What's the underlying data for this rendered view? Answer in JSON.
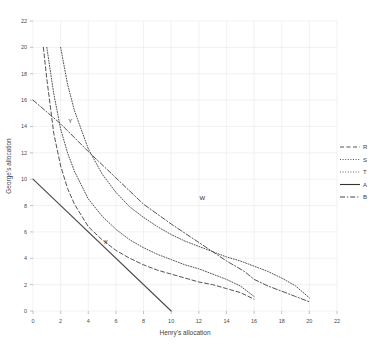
{
  "chart_data": {
    "type": "line",
    "title": "",
    "xlabel": "Henry's allocation",
    "ylabel": "George's allocation",
    "xlim": [
      0,
      22
    ],
    "ylim": [
      0,
      22
    ],
    "xticks": [
      0,
      2,
      4,
      6,
      8,
      10,
      12,
      14,
      16,
      18,
      20,
      22
    ],
    "yticks": [
      0,
      2,
      4,
      6,
      8,
      10,
      12,
      14,
      16,
      18,
      20,
      22
    ],
    "grid": true,
    "legend_position": "right",
    "series": [
      {
        "name": "R",
        "label": "R",
        "style": "dashed",
        "color": "#4a4a4a",
        "x": [
          0.75,
          1.0,
          1.5,
          2.0,
          2.5,
          3.0,
          4.0,
          5.0,
          6.0,
          7.0,
          8.0,
          9.0,
          10.0,
          11.0,
          12.0,
          13.0,
          14.0,
          15.0,
          16.0
        ],
        "y": [
          20.0,
          17.6,
          13.5,
          11.0,
          9.3,
          8.1,
          6.4,
          5.4,
          4.6,
          4.0,
          3.5,
          3.1,
          2.8,
          2.5,
          2.2,
          2.0,
          1.7,
          1.4,
          0.9
        ]
      },
      {
        "name": "S",
        "label": "S",
        "style": "dotted",
        "color": "#4a4a4a",
        "x": [
          1.0,
          1.5,
          2.0,
          2.5,
          3.0,
          4.0,
          5.0,
          6.0,
          7.0,
          8.0,
          9.0,
          10.0,
          11.0,
          12.0,
          13.0,
          14.0,
          15.0,
          16.0
        ],
        "y": [
          20.0,
          16.5,
          13.8,
          12.0,
          10.6,
          8.5,
          7.2,
          6.2,
          5.4,
          4.8,
          4.3,
          3.9,
          3.5,
          3.2,
          2.8,
          2.4,
          1.9,
          1.1
        ]
      },
      {
        "name": "T",
        "label": "T",
        "style": "dotted",
        "color": "#5a5a5a",
        "x": [
          2.0,
          2.5,
          3.0,
          4.0,
          5.0,
          6.0,
          7.0,
          8.0,
          9.0,
          10.0,
          11.0,
          12.0,
          13.0,
          14.0,
          15.0,
          16.0,
          17.0,
          18.0,
          19.0,
          20.0
        ],
        "y": [
          20.0,
          17.2,
          15.2,
          12.3,
          10.4,
          9.0,
          7.9,
          7.1,
          6.4,
          5.8,
          5.3,
          4.9,
          4.5,
          4.1,
          3.8,
          3.4,
          3.0,
          2.5,
          1.9,
          1.0
        ]
      },
      {
        "name": "A",
        "label": "A",
        "style": "solid",
        "color": "#333333",
        "x": [
          0,
          10
        ],
        "y": [
          10,
          0
        ]
      },
      {
        "name": "B",
        "label": "B",
        "style": "dashdot",
        "color": "#3d3d3d",
        "x": [
          0,
          2.0,
          4.0,
          6.0,
          8.0,
          10.0,
          12.0,
          14.0,
          15.3,
          16.0,
          17.0,
          18.0,
          19.0,
          20.0
        ],
        "y": [
          16,
          14.2,
          12.1,
          10.1,
          8.1,
          6.6,
          5.2,
          3.8,
          3.0,
          2.4,
          1.9,
          1.5,
          1.1,
          0.7
        ]
      }
    ],
    "annotations": [
      {
        "label": "W",
        "x": 11.9,
        "y": 8.3
      },
      {
        "label": "X",
        "x": 5.0,
        "y": 4.9
      },
      {
        "label": "Y",
        "x": 2.4,
        "y": 14.1
      }
    ]
  },
  "legend": {
    "entries": [
      {
        "key": "R",
        "style": "dashed"
      },
      {
        "key": "S",
        "style": "dotted"
      },
      {
        "key": "T",
        "style": "dotted"
      },
      {
        "key": "A",
        "style": "solid"
      },
      {
        "key": "B",
        "style": "dashdot"
      }
    ]
  }
}
